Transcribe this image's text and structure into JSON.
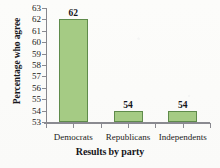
{
  "chart_data": {
    "type": "bar",
    "title": "",
    "subtitle": "",
    "xlabel": "Results by party",
    "ylabel": "Percentage who agree",
    "categories": [
      "Democrats",
      "Republicans",
      "Independents"
    ],
    "values": [
      62,
      54,
      54
    ],
    "data_labels": [
      "62",
      "54",
      "54"
    ],
    "ylim": [
      53,
      63
    ],
    "ytick_step": 1,
    "ytick_labels": [
      "63",
      "62",
      "61",
      "60",
      "59",
      "58",
      "57",
      "56",
      "55",
      "54",
      "53"
    ],
    "grid": false,
    "legend": null,
    "legend_position": "none",
    "colors": {
      "bar_fill": "#a5cb84",
      "bar_border": "#5f8b4b",
      "axis": "#8a8a90",
      "text": "#15151a",
      "background": "#fdfdfb"
    }
  }
}
